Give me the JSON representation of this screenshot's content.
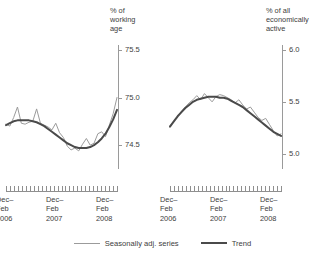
{
  "legend": {
    "items": [
      {
        "label": "Seasonally adj. series",
        "style": "thin",
        "color": "#9b9b9b",
        "icon": "line-swatch-icon"
      },
      {
        "label": "Trend",
        "style": "thick",
        "color": "#4a4a4a",
        "icon": "line-swatch-icon"
      }
    ]
  },
  "panels": {
    "left": {
      "axis_title": "% of\nworking\nage",
      "y_ticks": [
        "75.5",
        "75.0",
        "74.5"
      ],
      "x_labels": [
        "Dec–\nFeb\n2006",
        "Dec–\nFeb\n2007",
        "Dec–\nFeb\n2008"
      ]
    },
    "right": {
      "axis_title": "% of all\neconomically\nactive",
      "y_ticks": [
        "6.0",
        "5.5",
        "5.0"
      ],
      "x_labels": [
        "Dec–\nFeb\n2006",
        "Dec–\nFeb\n2007",
        "Dec–\nFeb\n2008"
      ]
    }
  },
  "chart_data": [
    {
      "type": "line",
      "id": "employment-rate-panel",
      "title": "% of working age",
      "xlabel": "",
      "ylabel": "% of working age",
      "ylim": [
        74.25,
        75.55
      ],
      "ytick_values": [
        74.5,
        75.0,
        75.5
      ],
      "grid": false,
      "legend_position": "bottom",
      "x_tick_count": 29,
      "x_labels": [
        "Dec-Feb 2006",
        "Dec-Feb 2007",
        "Dec-Feb 2008"
      ],
      "series": [
        {
          "name": "Seasonally adj. series",
          "color": "#9b9b9b",
          "width": 1,
          "values": [
            74.72,
            74.7,
            74.79,
            74.9,
            74.73,
            74.72,
            74.74,
            74.75,
            74.88,
            74.73,
            74.71,
            74.69,
            74.66,
            74.73,
            74.63,
            74.58,
            74.49,
            74.45,
            74.47,
            74.44,
            74.51,
            74.57,
            74.5,
            74.52,
            74.62,
            74.64,
            74.59,
            74.71,
            74.83,
            75.0
          ]
        },
        {
          "name": "Trend",
          "color": "#4a4a4a",
          "width": 2,
          "values": [
            74.71,
            74.73,
            74.75,
            74.76,
            74.76,
            74.76,
            74.76,
            74.75,
            74.74,
            74.72,
            74.7,
            74.67,
            74.64,
            74.61,
            74.58,
            74.55,
            74.52,
            74.5,
            74.48,
            74.47,
            74.47,
            74.47,
            74.48,
            74.5,
            74.53,
            74.57,
            74.62,
            74.69,
            74.77,
            74.87
          ]
        }
      ]
    },
    {
      "type": "line",
      "id": "unemployment-rate-panel",
      "title": "% of all economically active",
      "xlabel": "",
      "ylabel": "% of all economically active",
      "ylim": [
        4.85,
        6.05
      ],
      "ytick_values": [
        5.0,
        5.5,
        6.0
      ],
      "grid": false,
      "legend_position": "bottom",
      "x_tick_count": 29,
      "x_labels": [
        "Dec-Feb 2006",
        "Dec-Feb 2007",
        "Dec-Feb 2008"
      ],
      "series": [
        {
          "name": "Seasonally adj. series",
          "color": "#9b9b9b",
          "width": 1,
          "values": [
            5.27,
            5.31,
            5.36,
            5.41,
            5.45,
            5.49,
            5.52,
            5.56,
            5.52,
            5.58,
            5.54,
            5.5,
            5.55,
            5.57,
            5.56,
            5.54,
            5.52,
            5.49,
            5.52,
            5.47,
            5.43,
            5.45,
            5.4,
            5.35,
            5.32,
            5.34,
            5.28,
            5.22,
            5.17,
            5.19
          ]
        },
        {
          "name": "Trend",
          "color": "#4a4a4a",
          "width": 2,
          "values": [
            5.26,
            5.31,
            5.36,
            5.4,
            5.44,
            5.47,
            5.5,
            5.52,
            5.53,
            5.54,
            5.55,
            5.55,
            5.55,
            5.54,
            5.54,
            5.53,
            5.51,
            5.49,
            5.47,
            5.45,
            5.42,
            5.39,
            5.36,
            5.33,
            5.3,
            5.27,
            5.24,
            5.21,
            5.19,
            5.17
          ]
        }
      ]
    }
  ]
}
